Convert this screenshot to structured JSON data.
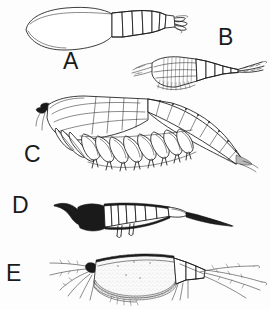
{
  "plate": {
    "width": 270,
    "height": 309,
    "background_color": "#fdfdfd",
    "ink_color": "#1a1a1a",
    "medium": "black-ink-line-drawing",
    "subject": "crustacean-specimens",
    "figure_count": 5
  },
  "figures": [
    {
      "id": "A",
      "label": "A",
      "label_position": {
        "x": 63,
        "y": 50
      },
      "description": "large-carapace-shrimp-lateral-view",
      "rendering": "outline-only",
      "parts": [
        "broad-oval-carapace",
        "segmented-abdomen",
        "uropod-tail-fan"
      ],
      "abdominal_segments": 6,
      "bbox": {
        "x": 24,
        "y": 6,
        "width": 160,
        "height": 46
      }
    },
    {
      "id": "B",
      "label": "B",
      "label_position": {
        "x": 218,
        "y": 26
      },
      "description": "small-mysid-shrimp-lateral-view",
      "rendering": "outline-with-fine-striations",
      "parts": [
        "antennae",
        "striated-carapace",
        "segmented-abdomen",
        "forked-telson"
      ],
      "abdominal_segments": 6,
      "bbox": {
        "x": 128,
        "y": 48,
        "width": 136,
        "height": 44
      }
    },
    {
      "id": "C",
      "label": "C",
      "label_position": {
        "x": 24,
        "y": 143
      },
      "description": "large-amphipod-thoracic-limbs-lateral-view",
      "rendering": "detailed-outline-with-cross-hatching",
      "parts": [
        "dark-compound-eye",
        "head",
        "thoracic-segments",
        "paired-pereopods",
        "abdominal-segments",
        "uropods"
      ],
      "thoracic_limb_pairs": 8,
      "bbox": {
        "x": 36,
        "y": 96,
        "width": 216,
        "height": 70
      }
    },
    {
      "id": "D",
      "label": "D",
      "label_position": {
        "x": 12,
        "y": 194
      },
      "description": "dark-filled-larval-crustacean-lateral-view",
      "rendering": "solid-black-fill-with-white-segments",
      "parts": [
        "rostrum",
        "dark-head",
        "segmented-trunk",
        "paired-ventral-appendages",
        "elongate-tapering-telson"
      ],
      "trunk_segments": 7,
      "bbox": {
        "x": 54,
        "y": 198,
        "width": 180,
        "height": 36
      }
    },
    {
      "id": "E",
      "label": "E",
      "label_position": {
        "x": 6,
        "y": 262
      },
      "description": "ostracod-or-cladoceran-bivalved-carapace-lateral-view",
      "rendering": "stippled-shaded-with-setae",
      "parts": [
        "plumose-antennae",
        "dark-dorsal-margin",
        "rounded-bivalved-carapace",
        "stippled-ventral-band",
        "segmented-abdomen",
        "long-caudal-setae"
      ],
      "bbox": {
        "x": 44,
        "y": 252,
        "width": 226,
        "height": 52
      }
    }
  ]
}
